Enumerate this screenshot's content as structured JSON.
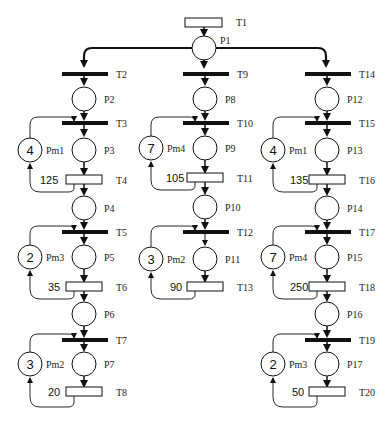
{
  "diagram": {
    "type": "petri-net",
    "top": {
      "transition": {
        "label": "T1"
      },
      "place": {
        "label": "P1"
      }
    },
    "branches": [
      {
        "name": "left",
        "stages": [
          {
            "t_in": "T2",
            "p_wait": "P2",
            "t_start": "T3",
            "p_work": "P3",
            "resource": {
              "label": "Pm1",
              "tokens": "4"
            },
            "t_end": "T4",
            "time": "125",
            "p_out": "P4"
          },
          {
            "t_start": "T5",
            "p_work": "P5",
            "resource": {
              "label": "Pm3",
              "tokens": "2"
            },
            "t_end": "T6",
            "time": "35",
            "p_out": "P6"
          },
          {
            "t_start": "T7",
            "p_work": "P7",
            "resource": {
              "label": "Pm2",
              "tokens": "3"
            },
            "t_end": "T8",
            "time": "20"
          }
        ]
      },
      {
        "name": "middle",
        "stages": [
          {
            "t_in": "T9",
            "p_wait": "P8",
            "t_start": "T10",
            "p_work": "P9",
            "resource": {
              "label": "Pm4",
              "tokens": "7"
            },
            "t_end": "T11",
            "time": "105",
            "p_out": "P10"
          },
          {
            "t_start": "T12",
            "p_work": "P11",
            "resource": {
              "label": "Pm2",
              "tokens": "3"
            },
            "t_end": "T13",
            "time": "90"
          }
        ]
      },
      {
        "name": "right",
        "stages": [
          {
            "t_in": "T14",
            "p_wait": "P12",
            "t_start": "T15",
            "p_work": "P13",
            "resource": {
              "label": "Pm1",
              "tokens": "4"
            },
            "t_end": "T16",
            "time": "135",
            "p_out": "P14"
          },
          {
            "t_start": "T17",
            "p_work": "P15",
            "resource": {
              "label": "Pm4",
              "tokens": "7"
            },
            "t_end": "T18",
            "time": "250",
            "p_out": "P16"
          },
          {
            "t_start": "T19",
            "p_work": "P17",
            "resource": {
              "label": "Pm3",
              "tokens": "2"
            },
            "t_end": "T20",
            "time": "50"
          }
        ]
      }
    ]
  }
}
